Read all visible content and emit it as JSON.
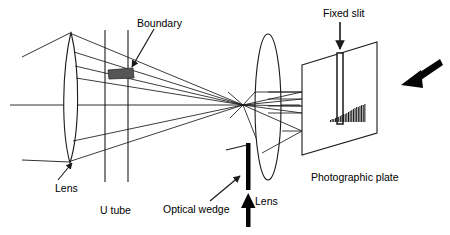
{
  "figure": {
    "type": "optical-diagram",
    "background_color": "#ffffff",
    "stroke_color": "#1a1a1a",
    "fill_dark": "#2b2b2b"
  },
  "labels": {
    "boundary": "Boundary",
    "fixed_slit": "Fixed slit",
    "lens_left": "Lens",
    "u_tube": "U tube",
    "optical_wedge": "Optical wedge",
    "lens_right": "Lens",
    "photographic_plate": "Photographic plate"
  },
  "components": {
    "lens_left": {
      "name": "Lens",
      "center_x": 71,
      "top_y": 32,
      "bottom_y": 163,
      "half_width": 9
    },
    "lens_right": {
      "name": "Lens",
      "center_x": 268,
      "top_y": 35,
      "bottom_y": 180,
      "half_width": 13
    },
    "u_tube": {
      "name": "U tube",
      "line_x": [
        105,
        128
      ],
      "top_y": 30,
      "bottom_y": 182
    },
    "boundary": {
      "name": "Boundary",
      "shade_x": [
        108,
        134
      ],
      "shade_y": [
        67,
        78
      ]
    },
    "optical_wedge": {
      "name": "Optical wedge",
      "x": 248,
      "top_y": 143,
      "bottom_y": 190,
      "thickness": 4
    },
    "photographic_plate": {
      "name": "Photographic plate",
      "left_top": [
        302,
        65
      ],
      "left_bottom": [
        302,
        155
      ],
      "right_top": [
        377,
        42
      ],
      "right_bottom": [
        377,
        133
      ]
    },
    "fixed_slit": {
      "name": "Fixed slit",
      "x": [
        337,
        343
      ],
      "top_y": 53,
      "bottom_y": 124
    },
    "spectrum": {
      "name": "Spectrum fringes",
      "x_start": 330,
      "x_end": 366,
      "baseline_y": 122,
      "bar_count": 22,
      "max_height": 18
    },
    "focus_point": {
      "x": 243,
      "y": 105
    }
  },
  "arrows": {
    "boundary_pointer": {
      "from": [
        152,
        28
      ],
      "to": [
        131,
        68
      ]
    },
    "fixed_slit_pointer": {
      "from": [
        340,
        22
      ],
      "to": [
        340,
        50
      ]
    },
    "lens_left_pointer": {
      "from": [
        62,
        180
      ],
      "to": [
        76,
        162
      ]
    },
    "optical_wedge_pointer": {
      "from": [
        213,
        200
      ],
      "to": [
        239,
        176
      ]
    },
    "wedge_up_arrow": {
      "from": [
        248,
        226
      ],
      "to": [
        248,
        196
      ]
    },
    "incoming_beam_arrow": {
      "from": [
        441,
        60
      ],
      "to": [
        404,
        84
      ]
    }
  },
  "chart_data": {
    "type": "bar",
    "categories": [
      "1",
      "2",
      "3",
      "4",
      "5",
      "6",
      "7",
      "8",
      "9",
      "10",
      "11",
      "12",
      "13",
      "14",
      "15",
      "16",
      "17",
      "18",
      "19",
      "20",
      "21",
      "22"
    ],
    "values": [
      2,
      3,
      3,
      4,
      5,
      5,
      6,
      7,
      8,
      8,
      9,
      10,
      11,
      12,
      13,
      14,
      15,
      15,
      16,
      17,
      17,
      18
    ],
    "xlabel": "",
    "ylabel": "",
    "ylim": [
      0,
      18
    ]
  }
}
